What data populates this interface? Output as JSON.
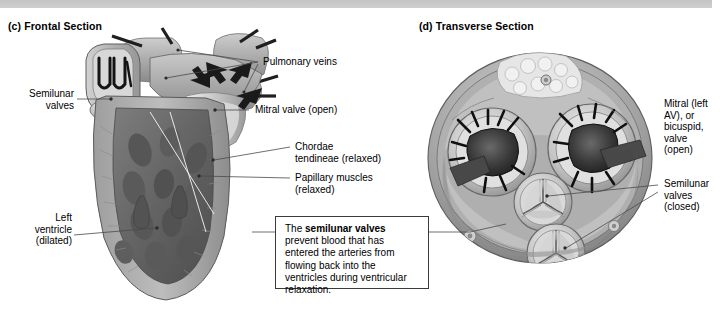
{
  "figure": {
    "panels": [
      {
        "id": "c",
        "title": "(c) Frontal Section"
      },
      {
        "id": "d",
        "title": "(d) Transverse Section"
      }
    ]
  },
  "frontal_labels": {
    "semilunar_valves": "Semilunar\nvalves",
    "semilunar_valves_l1": "Semilunar",
    "semilunar_valves_l2": "valves",
    "left_ventricle_l1": "Left",
    "left_ventricle_l2": "ventricle",
    "left_ventricle_l3": "(dilated)",
    "pulmonary_veins": "Pulmonary  veins",
    "mitral_valve": "Mitral valve (open)",
    "chordae_l1": "Chordae",
    "chordae_l2": "tendineae (relaxed)",
    "papillary_l1": "Papillary muscles",
    "papillary_l2": "(relaxed)"
  },
  "transverse_labels": {
    "mitral_l1": "Mitral (left",
    "mitral_l2": "AV), or",
    "mitral_l3": "bicuspid,",
    "mitral_l4": "valve",
    "mitral_l5": "(open)",
    "semilunar_l1": "Semilunar",
    "semilunar_l2": "valves",
    "semilunar_l3": "(closed)"
  },
  "callout": {
    "text_before": "The ",
    "bold": "semilunar valves",
    "text_after": " prevent blood that has entered the arteries from flowing back into the ventricles during ventricular relaxation."
  },
  "colors": {
    "banner": "#c8c8c8",
    "leader": "#4a4a4a",
    "box_border": "#3a3a3a",
    "text": "#000000",
    "myocardium_light": "#b9b9b9",
    "myocardium_mid": "#9a9a9a",
    "chamber_dark": "#6f6f6f",
    "chamber_deep": "#4b4b4b",
    "valve_black": "#1c1c1c",
    "highlight": "#e3e3e3"
  }
}
